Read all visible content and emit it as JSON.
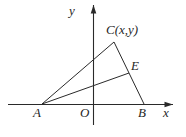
{
  "figure": {
    "labels": {
      "y_axis": "y",
      "x_axis": "x",
      "origin": "O",
      "vertex_a": "A",
      "vertex_b": "B",
      "vertex_c": "C(x,y)",
      "point_e": "E"
    },
    "colors": {
      "line": "#2a2a2a",
      "background": "#ffffff"
    },
    "geometry": {
      "points": {
        "A": [
          42,
          104
        ],
        "B": [
          144,
          104
        ],
        "C": [
          114,
          42
        ],
        "E": [
          129,
          73
        ]
      },
      "segments": [
        [
          "A",
          "C"
        ],
        [
          "C",
          "B"
        ],
        [
          "A",
          "E"
        ]
      ],
      "x_axis": {
        "from": [
          8,
          104.5
        ],
        "to": [
          173,
          104.5
        ]
      },
      "y_axis": {
        "from": [
          93.5,
          125
        ],
        "to": [
          93.5,
          5
        ]
      }
    }
  }
}
